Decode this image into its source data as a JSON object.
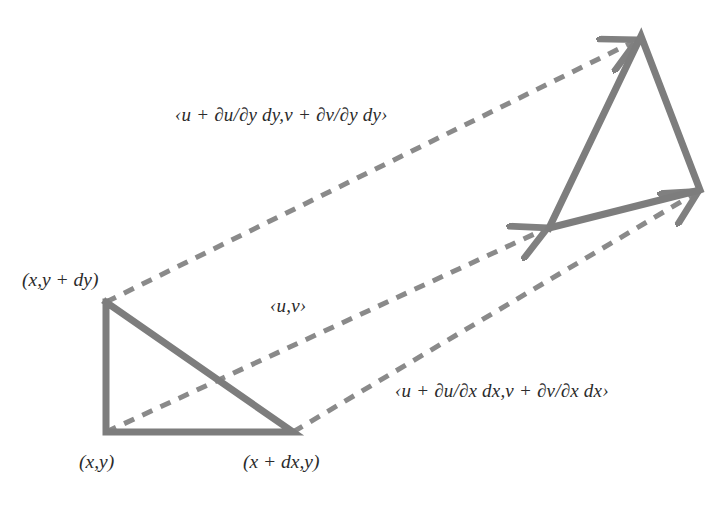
{
  "figure": {
    "background_color": "#ffffff",
    "stroke_color": "#808080",
    "text_color": "#2b2b2b",
    "solid_line_width": 7,
    "dashed_line_width": 5,
    "dash_pattern": "11 9"
  },
  "labels": {
    "top_vector": "‹u + ∂u/∂y dy,v + ∂v/∂y dy›",
    "mid_vector": "‹u,v›",
    "bottom_vector": "‹u + ∂u/∂x dx,v + ∂v/∂x dx›",
    "point_x_y_plus_dy": "(x,y + dy)",
    "point_x_y": "(x,y)",
    "point_x_plus_dx_y": "(x + dx,y)"
  },
  "geometry": {
    "original_triangle": {
      "name": "original-fluid-element",
      "vertices": [
        {
          "name": "(x,y + dy)",
          "x": 106,
          "y": 302
        },
        {
          "name": "(x + dx,y)",
          "x": 293,
          "y": 432
        },
        {
          "name": "(x,y)",
          "x": 106,
          "y": 432
        }
      ]
    },
    "displaced_triangle": {
      "name": "displaced-fluid-element",
      "vertices": [
        {
          "name": "apex",
          "x": 641,
          "y": 36
        },
        {
          "name": "right",
          "x": 700,
          "y": 190
        },
        {
          "name": "left",
          "x": 549,
          "y": 228
        }
      ]
    },
    "displacement_vectors": [
      {
        "name": "top-displacement-vector",
        "from": [
          106,
          302
        ],
        "to": [
          637,
          40
        ]
      },
      {
        "name": "mid-displacement-vector",
        "from": [
          106,
          432
        ],
        "to": [
          546,
          229
        ]
      },
      {
        "name": "bottom-displacement-vector",
        "from": [
          293,
          432
        ],
        "to": [
          698,
          192
        ]
      }
    ]
  }
}
